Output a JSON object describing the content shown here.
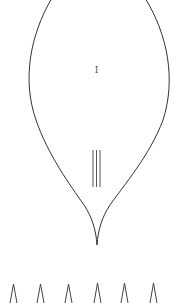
{
  "diagram": {
    "shape_label": "I",
    "stroke_color": "#333333",
    "background": "#ffffff",
    "veins": {
      "count": 3
    },
    "spikes": {
      "count": 6,
      "glyph": "Λ"
    }
  }
}
